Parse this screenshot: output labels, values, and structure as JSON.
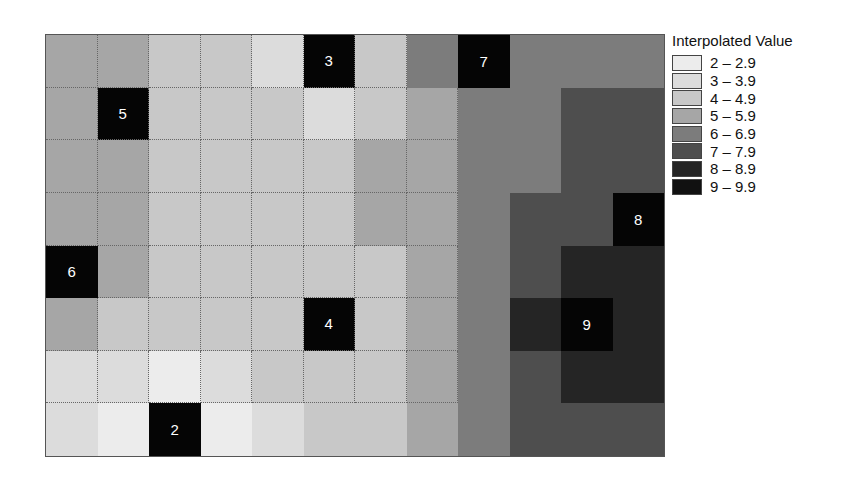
{
  "chart_data": {
    "type": "heatmap",
    "title": "",
    "legend_title": "Interpolated Value",
    "legend_position": "right",
    "rows": 8,
    "cols": 12,
    "classes": [
      {
        "min": 2,
        "label": "2 – 2.9",
        "color": "#ececec"
      },
      {
        "min": 3,
        "label": "3 – 3.9",
        "color": "#dcdcdc"
      },
      {
        "min": 4,
        "label": "4 – 4.9",
        "color": "#c8c8c8"
      },
      {
        "min": 5,
        "label": "5 – 5.9",
        "color": "#a6a6a6"
      },
      {
        "min": 6,
        "label": "6 – 6.9",
        "color": "#7c7c7c"
      },
      {
        "min": 7,
        "label": "7 – 7.9",
        "color": "#4e4e4e"
      },
      {
        "min": 8,
        "label": "8 – 8.9",
        "color": "#252525"
      },
      {
        "min": 9,
        "label": "9 – 9.9",
        "color": "#111111"
      }
    ],
    "grid_values": [
      [
        5,
        5,
        4,
        4,
        3,
        3,
        4,
        6,
        7,
        6,
        6,
        6
      ],
      [
        5,
        5,
        4,
        4,
        4,
        3,
        4,
        5,
        6,
        6,
        7,
        7
      ],
      [
        5,
        5,
        4,
        4,
        4,
        4,
        5,
        5,
        6,
        6,
        7,
        7
      ],
      [
        5,
        5,
        4,
        4,
        4,
        4,
        5,
        5,
        6,
        7,
        7,
        8
      ],
      [
        6,
        5,
        4,
        4,
        4,
        4,
        4,
        5,
        6,
        7,
        8,
        8
      ],
      [
        5,
        4,
        4,
        4,
        4,
        4,
        4,
        5,
        6,
        8,
        9,
        8
      ],
      [
        3,
        3,
        2,
        3,
        4,
        4,
        4,
        5,
        6,
        7,
        8,
        8
      ],
      [
        3,
        2,
        2,
        2,
        3,
        4,
        4,
        5,
        6,
        7,
        7,
        7
      ]
    ],
    "sample_points": [
      {
        "row": 0,
        "col": 5,
        "value": "3"
      },
      {
        "row": 0,
        "col": 8,
        "value": "7"
      },
      {
        "row": 1,
        "col": 1,
        "value": "5"
      },
      {
        "row": 3,
        "col": 11,
        "value": "8"
      },
      {
        "row": 4,
        "col": 0,
        "value": "6"
      },
      {
        "row": 5,
        "col": 5,
        "value": "4"
      },
      {
        "row": 5,
        "col": 10,
        "value": "9"
      },
      {
        "row": 7,
        "col": 2,
        "value": "2"
      }
    ],
    "grid_lines": "dotted on light cells (values below 6)"
  }
}
